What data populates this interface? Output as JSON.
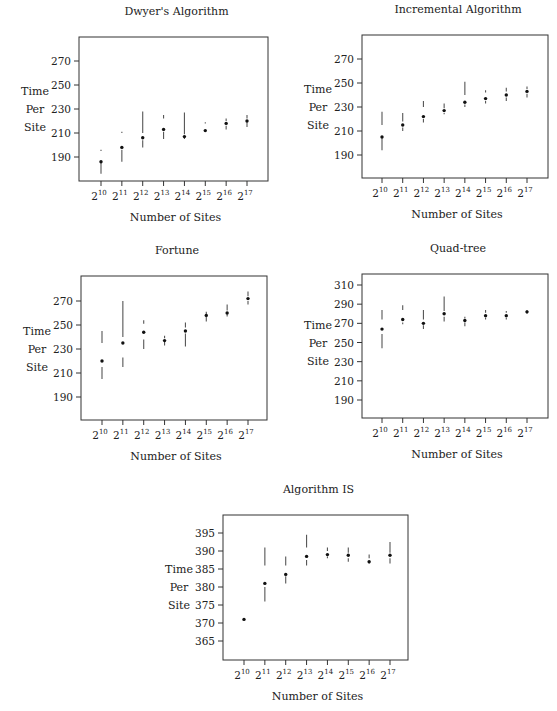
{
  "figure": {
    "ylabel_lines": [
      "Time",
      "Per",
      "Site"
    ],
    "xlabel": "Number of Sites",
    "x_tick_base": "2",
    "x_tick_exponents": [
      "10",
      "11",
      "12",
      "13",
      "14",
      "15",
      "16",
      "17"
    ]
  },
  "chart_data": [
    {
      "type": "scatter",
      "title": "Dwyer's Algorithm",
      "xlabel": "Number of Sites",
      "ylabel": "Time Per Site",
      "categories": [
        "2^10",
        "2^11",
        "2^12",
        "2^13",
        "2^14",
        "2^15",
        "2^16",
        "2^17"
      ],
      "yticks": [
        190,
        210,
        230,
        250,
        270
      ],
      "ylim": [
        172,
        290
      ],
      "grid": false,
      "median": [
        186,
        198,
        206,
        213,
        207,
        212,
        218,
        220
      ],
      "upper_whisker": [
        [
          195,
          196
        ],
        [
          210,
          211
        ],
        [
          210,
          228
        ],
        [
          222,
          225
        ],
        [
          209,
          227
        ],
        [
          218,
          219
        ],
        [
          220,
          222
        ],
        [
          222,
          225
        ]
      ],
      "lower_whisker": [
        [
          176,
          185
        ],
        [
          186,
          196
        ],
        [
          198,
          204
        ],
        [
          205,
          211
        ],
        [
          205,
          206
        ],
        [
          211,
          211
        ],
        [
          213,
          216
        ],
        [
          215,
          219
        ]
      ],
      "frame": [
        79,
        37,
        268,
        181
      ],
      "ymap": [
        270,
        61,
        190,
        157
      ],
      "xmap": [
        101,
        247
      ]
    },
    {
      "type": "scatter",
      "title": "Incremental Algorithm",
      "xlabel": "Number of Sites",
      "ylabel": "Time Per Site",
      "categories": [
        "2^10",
        "2^11",
        "2^12",
        "2^13",
        "2^14",
        "2^15",
        "2^16",
        "2^17"
      ],
      "yticks": [
        190,
        210,
        230,
        250,
        270
      ],
      "ylim": [
        172,
        290
      ],
      "grid": false,
      "median": [
        205,
        215,
        222,
        227,
        234,
        237,
        240,
        243
      ],
      "upper_whisker": [
        [
          215,
          226
        ],
        [
          218,
          225
        ],
        [
          230,
          235
        ],
        [
          229,
          233
        ],
        [
          240,
          251
        ],
        [
          242,
          244
        ],
        [
          243,
          246
        ],
        [
          245,
          247
        ]
      ],
      "lower_whisker": [
        [
          194,
          204
        ],
        [
          210,
          213
        ],
        [
          217,
          220
        ],
        [
          224,
          225
        ],
        [
          230,
          232
        ],
        [
          233,
          235
        ],
        [
          235,
          238
        ],
        [
          238,
          241
        ]
      ],
      "frame": [
        362,
        35,
        548,
        178
      ],
      "ymap": [
        270,
        59,
        190,
        155
      ],
      "xmap": [
        382,
        527
      ]
    },
    {
      "type": "scatter",
      "title": "Fortune",
      "xlabel": "Number of Sites",
      "ylabel": "Time Per Site",
      "categories": [
        "2^10",
        "2^11",
        "2^12",
        "2^13",
        "2^14",
        "2^15",
        "2^16",
        "2^17"
      ],
      "yticks": [
        190,
        210,
        230,
        250,
        270
      ],
      "ylim": [
        172,
        290
      ],
      "grid": false,
      "median": [
        220,
        235,
        244,
        237,
        245,
        258,
        260,
        272
      ],
      "upper_whisker": [
        [
          235,
          245
        ],
        [
          240,
          270
        ],
        [
          251,
          254
        ],
        [
          239,
          241
        ],
        [
          248,
          252
        ],
        [
          259,
          261
        ],
        [
          262,
          267
        ],
        [
          274,
          278
        ]
      ],
      "lower_whisker": [
        [
          205,
          215
        ],
        [
          215,
          223
        ],
        [
          230,
          238
        ],
        [
          233,
          236
        ],
        [
          232,
          243
        ],
        [
          253,
          257
        ],
        [
          257,
          259
        ],
        [
          267,
          270
        ]
      ],
      "frame": [
        81,
        276,
        267,
        420
      ],
      "ymap": [
        270,
        301,
        190,
        397
      ],
      "xmap": [
        102,
        248
      ]
    },
    {
      "type": "scatter",
      "title": "Quad-tree",
      "xlabel": "Number of Sites",
      "ylabel": "Time Per Site",
      "categories": [
        "2^10",
        "2^11",
        "2^12",
        "2^13",
        "2^14",
        "2^15",
        "2^16",
        "2^17"
      ],
      "yticks": [
        190,
        210,
        230,
        250,
        270,
        290,
        310
      ],
      "ylim": [
        172,
        318
      ],
      "grid": false,
      "median": [
        264,
        274,
        270,
        280,
        273,
        278,
        278,
        282
      ],
      "upper_whisker": [
        [
          274,
          284
        ],
        [
          284,
          289
        ],
        [
          274,
          284
        ],
        [
          283,
          298
        ],
        [
          275,
          277
        ],
        [
          281,
          284
        ],
        [
          281,
          283
        ],
        [
          283,
          284
        ]
      ],
      "lower_whisker": [
        [
          244,
          259
        ],
        [
          269,
          271
        ],
        [
          264,
          268
        ],
        [
          272,
          277
        ],
        [
          267,
          271
        ],
        [
          274,
          276
        ],
        [
          274,
          276
        ],
        [
          280,
          281
        ]
      ],
      "frame": [
        362,
        274,
        548,
        418
      ],
      "ymap": [
        310,
        285,
        190,
        400
      ],
      "xmap": [
        382,
        527
      ]
    },
    {
      "type": "scatter",
      "title": "Algorithm IS",
      "xlabel": "Number of Sites",
      "ylabel": "Time Per Site",
      "categories": [
        "2^10",
        "2^11",
        "2^12",
        "2^13",
        "2^14",
        "2^15",
        "2^16",
        "2^17"
      ],
      "yticks": [
        365,
        370,
        375,
        380,
        385,
        390,
        395
      ],
      "ylim": [
        360,
        400
      ],
      "grid": false,
      "median": [
        371,
        381,
        383.5,
        388.5,
        389,
        388.8,
        387,
        388.8
      ],
      "upper_whisker": [
        [
          371,
          371
        ],
        [
          386,
          391
        ],
        [
          386,
          388.5
        ],
        [
          391,
          394.5
        ],
        [
          390,
          391
        ],
        [
          389.5,
          391
        ],
        [
          388,
          389
        ],
        [
          389.5,
          392.5
        ]
      ],
      "lower_whisker": [
        [
          371,
          371
        ],
        [
          376,
          380
        ],
        [
          381,
          383
        ],
        [
          386,
          387.5
        ],
        [
          388,
          388.5
        ],
        [
          387,
          388
        ],
        [
          386.5,
          387
        ],
        [
          386.5,
          388
        ]
      ],
      "frame": [
        223,
        515,
        408,
        660
      ],
      "ymap": [
        395,
        533,
        365,
        641
      ],
      "xmap": [
        244,
        390
      ]
    }
  ]
}
